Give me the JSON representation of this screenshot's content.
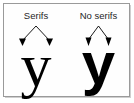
{
  "figure": {
    "background_color": "#ffffff",
    "border_color": "#9a9a9a",
    "ink_color": "#000000"
  },
  "panels": [
    {
      "id": "serif",
      "caption": "Serifs",
      "glyph": "y",
      "typeface_style": "serif",
      "pointer": {
        "shape": "inverted-v-with-arrowheads",
        "arrow_count": 2,
        "points_to": "serif terminals"
      }
    },
    {
      "id": "sans",
      "caption": "No serifs",
      "glyph": "y",
      "typeface_style": "sans-serif-bold",
      "pointer": {
        "shape": "inverted-v-with-arrowheads",
        "arrow_count": 2,
        "points_to": "plain stroke terminals"
      }
    }
  ]
}
